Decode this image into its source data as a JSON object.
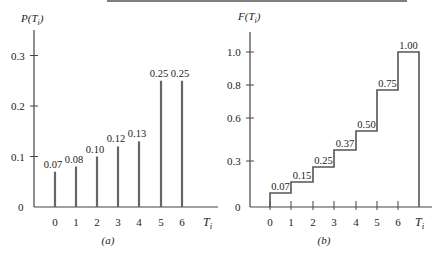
{
  "header_rule": {
    "x1": 107,
    "x2": 407,
    "y": 1
  },
  "chart_data": [
    {
      "type": "bar",
      "panel_label": "(a)",
      "ylabel": "P(T_i)",
      "xlabel": "T_i",
      "categories": [
        "0",
        "1",
        "2",
        "3",
        "4",
        "5",
        "6"
      ],
      "values": [
        0.07,
        0.08,
        0.1,
        0.12,
        0.13,
        0.25,
        0.25
      ],
      "data_labels": [
        "0.07",
        "0.08",
        "0.10",
        "0.12",
        "0.13",
        "0.25",
        "0.25"
      ],
      "yticks": [
        "0",
        "0.1",
        "0.2",
        "0.3"
      ],
      "ylim": [
        0,
        0.33
      ],
      "grid": false
    },
    {
      "type": "line",
      "style": "step",
      "panel_label": "(b)",
      "ylabel": "F(T_i)",
      "xlabel": "T_i",
      "categories": [
        "0",
        "1",
        "2",
        "3",
        "4",
        "5",
        "6"
      ],
      "values": [
        0.07,
        0.15,
        0.25,
        0.37,
        0.5,
        0.75,
        1.0
      ],
      "data_labels": [
        "0.07",
        "0.15",
        "0.25",
        "0.37",
        "0.50",
        "0.75",
        "1.00"
      ],
      "yticks": [
        "0",
        "0.3",
        "0.6",
        "0.8",
        "1.0"
      ],
      "ylim": [
        0,
        1.1
      ],
      "grid": false
    }
  ]
}
